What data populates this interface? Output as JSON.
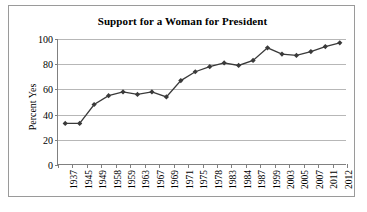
{
  "chart_data": {
    "type": "line",
    "title": "Support for a Woman for President",
    "xlabel": "",
    "ylabel": "Percent Yes",
    "ylim": [
      0,
      100
    ],
    "yticks": [
      0,
      20,
      40,
      60,
      80,
      100
    ],
    "grid": true,
    "legend": "none",
    "marker": "diamond",
    "categories": [
      "1937",
      "1945",
      "1949",
      "1958",
      "1959",
      "1963",
      "1967",
      "1969",
      "1971",
      "1975",
      "1978",
      "1983",
      "1984",
      "1987",
      "1999",
      "2003",
      "2005",
      "2007",
      "2011",
      "2012"
    ],
    "values": [
      33,
      33,
      48,
      55,
      58,
      56,
      58,
      54,
      67,
      74,
      78,
      81,
      79,
      83,
      93,
      88,
      87,
      90,
      94,
      97
    ],
    "series": [
      {
        "name": "Percent Yes",
        "values": [
          33,
          33,
          48,
          55,
          58,
          56,
          58,
          54,
          67,
          74,
          78,
          81,
          79,
          83,
          93,
          88,
          87,
          90,
          94,
          97
        ]
      }
    ]
  },
  "colors": {
    "line": "#3a3a3a",
    "grid": "#b7b7b7",
    "axis": "#808080",
    "frame": "#9a9a9a",
    "background": "#ffffff",
    "text": "#000000"
  }
}
